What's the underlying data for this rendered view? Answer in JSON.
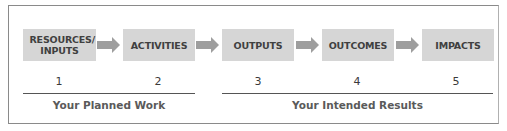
{
  "diagram": {
    "type": "logic-model",
    "steps": [
      {
        "label": "RESOURCES/ INPUTS",
        "number": "1"
      },
      {
        "label": "ACTIVITIES",
        "number": "2"
      },
      {
        "label": "OUTPUTS",
        "number": "3"
      },
      {
        "label": "OUTCOMES",
        "number": "4"
      },
      {
        "label": "IMPACTS",
        "number": "5"
      }
    ],
    "groups": [
      {
        "label": "Your Planned Work",
        "spans": [
          1,
          2
        ]
      },
      {
        "label": "Your Intended Results",
        "spans": [
          3,
          4,
          5
        ]
      }
    ],
    "colors": {
      "box_fill": "#d6d6d6",
      "arrow_fill": "#9e9e9e",
      "box_text": "#404040",
      "group_text": "#5a5a5a",
      "rule": "#555555",
      "frame": "#8a8a8a"
    }
  }
}
